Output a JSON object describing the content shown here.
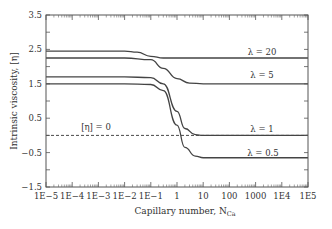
{
  "chart_data": {
    "type": "line",
    "title": "",
    "xlabel": "Capillary number, N",
    "xlabel_sub": "Ca",
    "ylabel": "Intrinsic viscosity, [η]",
    "xscale": "log",
    "xlim": [
      1e-05,
      100000.0
    ],
    "ylim": [
      -1.5,
      3.5
    ],
    "x_tick_labels": [
      "1E−5",
      "1E−4",
      "1E−3",
      "1E−2",
      "1E−1",
      "1",
      "10",
      "100",
      "1000",
      "1E4",
      "1E5"
    ],
    "y_tick_labels": [
      "3.5",
      "2.5",
      "1.5",
      "0.5",
      "−0.5",
      "−1.5"
    ],
    "y_ticks": [
      3.5,
      2.5,
      1.5,
      0.5,
      -0.5,
      -1.5
    ],
    "grid": false,
    "legend": "inline labels",
    "series": [
      {
        "name": "λ = 20",
        "x": [
          1e-05,
          0.001,
          0.01,
          0.03,
          0.1,
          0.3,
          1,
          10,
          100,
          100000.0
        ],
        "y": [
          2.45,
          2.45,
          2.45,
          2.42,
          2.3,
          2.25,
          2.25,
          2.25,
          2.25,
          2.25
        ]
      },
      {
        "name": "λ = 5",
        "x": [
          1e-05,
          0.001,
          0.01,
          0.1,
          0.3,
          1,
          3,
          10,
          100,
          100000.0
        ],
        "y": [
          2.25,
          2.25,
          2.25,
          2.2,
          1.95,
          1.65,
          1.52,
          1.5,
          1.5,
          1.5
        ]
      },
      {
        "name": "λ = 1",
        "x": [
          1e-05,
          0.001,
          0.01,
          0.1,
          0.3,
          1,
          2,
          5,
          10,
          100,
          100000.0
        ],
        "y": [
          1.7,
          1.7,
          1.7,
          1.68,
          1.5,
          0.7,
          0.2,
          0.02,
          0.0,
          0.0,
          0.0
        ]
      },
      {
        "name": "λ = 0.5",
        "x": [
          1e-05,
          0.001,
          0.01,
          0.1,
          0.3,
          1,
          2,
          5,
          10,
          100,
          100000.0
        ],
        "y": [
          1.5,
          1.5,
          1.5,
          1.48,
          1.3,
          0.3,
          -0.35,
          -0.6,
          -0.65,
          -0.65,
          -0.65
        ]
      }
    ],
    "annotations": [
      {
        "text": "[η] = 0",
        "style": "dashed reference line",
        "y": 0
      },
      {
        "text": "λ = 20",
        "x": 3000,
        "y": 2.4
      },
      {
        "text": "λ = 5",
        "x": 3000,
        "y": 1.68
      },
      {
        "text": "λ = 1",
        "x": 3000,
        "y": 0.15
      },
      {
        "text": "λ = 0.5",
        "x": 3000,
        "y": -0.5
      }
    ]
  },
  "labels": {
    "ref_line": "[η] = 0",
    "lambda20": "λ = 20",
    "lambda5": "λ = 5",
    "lambda1": "λ = 1",
    "lambda05": "λ = 0.5"
  }
}
